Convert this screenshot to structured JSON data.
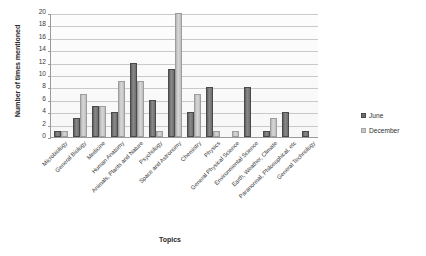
{
  "chart_data": {
    "type": "bar",
    "title": "",
    "xlabel": "Topics",
    "ylabel": "Number of times mentioned",
    "ylim": [
      0,
      20
    ],
    "ytick_step": 2,
    "yticks": [
      20,
      18,
      16,
      14,
      12,
      10,
      8,
      6,
      4,
      2,
      0
    ],
    "grid": "horizontal",
    "legend_position": "right",
    "categories": [
      "Microbiology",
      "General Biology",
      "Medicine",
      "Human Anatomy",
      "Animals, Plants and Nature",
      "Psychology",
      "Space and Astronomy",
      "Chemistry",
      "Physics",
      "General Physical Science",
      "Environmental Science",
      "Earth, Weather, Climate",
      "Paranormal, Philosophical, etc",
      "General Technology"
    ],
    "series": [
      {
        "name": "June",
        "color": "#6e6e6e",
        "values": [
          1,
          3,
          5,
          4,
          12,
          6,
          11,
          4,
          8,
          0,
          8,
          1,
          4,
          1
        ]
      },
      {
        "name": "December",
        "color": "#c9c9c9",
        "values": [
          1,
          7,
          5,
          9,
          9,
          1,
          20,
          7,
          1,
          1,
          0,
          3,
          0,
          0
        ]
      }
    ]
  },
  "legend": {
    "items": [
      {
        "label": "June"
      },
      {
        "label": "December"
      }
    ]
  }
}
